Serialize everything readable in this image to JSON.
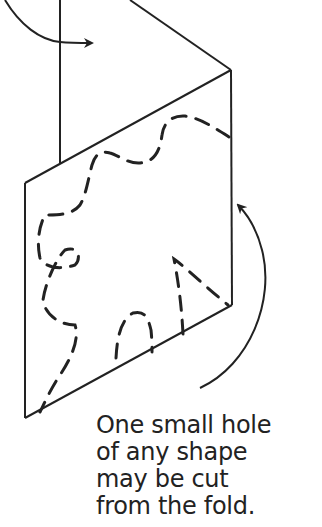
{
  "figure": {
    "colors": {
      "ink": "#222222",
      "background": "#ffffff"
    },
    "caption_lines": [
      "One small hole",
      "of any shape",
      "may be cut",
      "from the fold."
    ],
    "elements": [
      {
        "name": "upper-panel",
        "type": "folded paper panel"
      },
      {
        "name": "lower-panel",
        "type": "paper panel with dashed cut outlines"
      },
      {
        "name": "fold-arrow-top",
        "type": "curved arrow"
      },
      {
        "name": "fold-arrow-right",
        "type": "curved arrow"
      }
    ]
  }
}
